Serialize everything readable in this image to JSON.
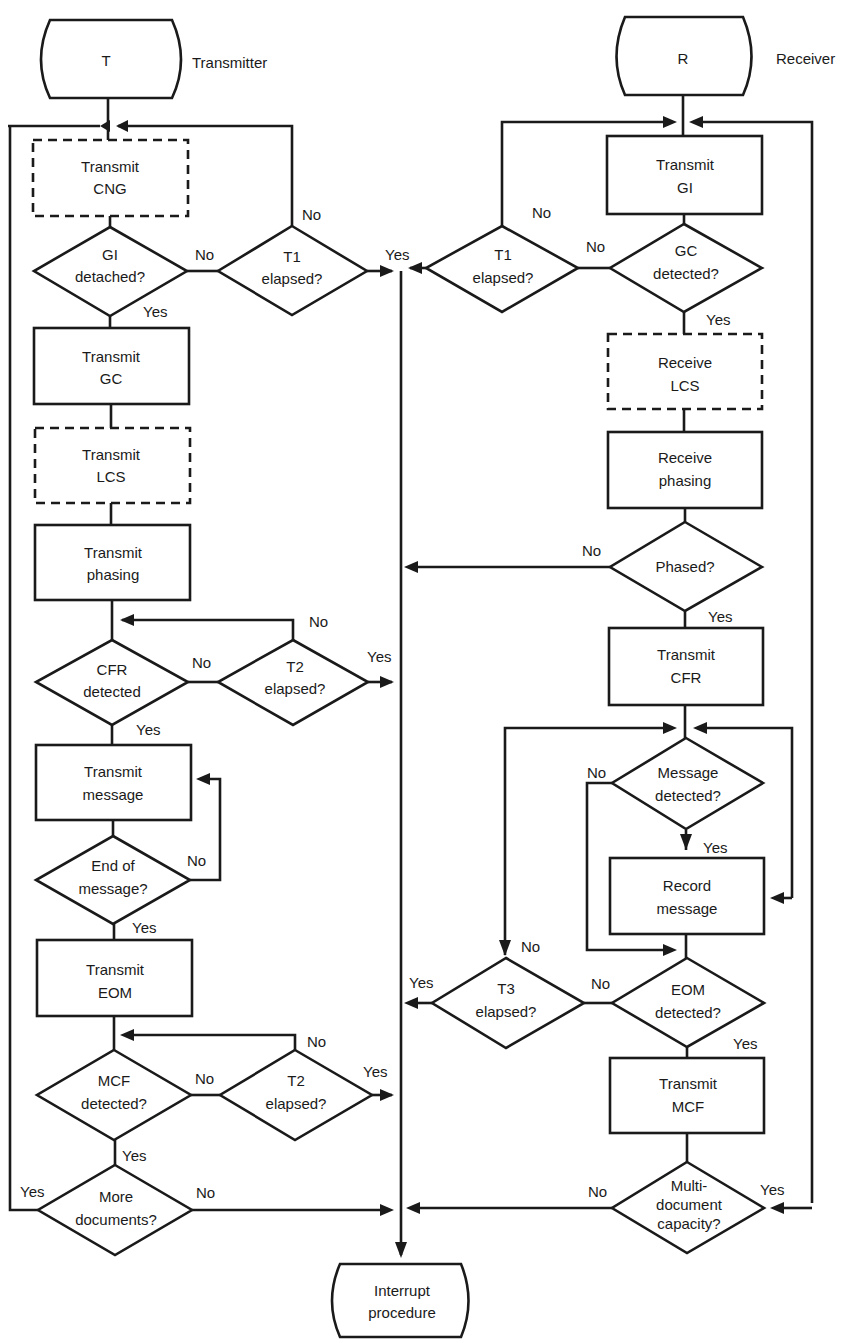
{
  "colors": {
    "stroke": "#1a1a1a",
    "background": "#ffffff"
  },
  "terminals": {
    "transmitter": {
      "symbol": "T",
      "caption": "Transmitter"
    },
    "receiver": {
      "symbol": "R",
      "caption": "Receiver"
    },
    "interrupt": {
      "line1": "Interrupt",
      "line2": "procedure"
    }
  },
  "transmitter": {
    "transmit_cng": {
      "line1": "Transmit",
      "line2": "CNG",
      "style": "dashed"
    },
    "gi_detached": {
      "line1": "GI",
      "line2": "detached?"
    },
    "t1_elapsed": {
      "line1": "T1",
      "line2": "elapsed?"
    },
    "transmit_gc": {
      "line1": "Transmit",
      "line2": "GC"
    },
    "transmit_lcs": {
      "line1": "Transmit",
      "line2": "LCS",
      "style": "dashed"
    },
    "transmit_phasing": {
      "line1": "Transmit",
      "line2": "phasing"
    },
    "cfr_detected": {
      "line1": "CFR",
      "line2": "detected"
    },
    "t2_elapsed_a": {
      "line1": "T2",
      "line2": "elapsed?"
    },
    "transmit_message": {
      "line1": "Transmit",
      "line2": "message"
    },
    "end_of_message": {
      "line1": "End of",
      "line2": "message?"
    },
    "transmit_eom": {
      "line1": "Transmit",
      "line2": "EOM"
    },
    "mcf_detected": {
      "line1": "MCF",
      "line2": "detected?"
    },
    "t2_elapsed_b": {
      "line1": "T2",
      "line2": "elapsed?"
    },
    "more_documents": {
      "line1": "More",
      "line2": "documents?"
    }
  },
  "receiver": {
    "transmit_gi": {
      "line1": "Transmit",
      "line2": "GI"
    },
    "t1_elapsed": {
      "line1": "T1",
      "line2": "elapsed?"
    },
    "gc_detected": {
      "line1": "GC",
      "line2": "detected?"
    },
    "receive_lcs": {
      "line1": "Receive",
      "line2": "LCS",
      "style": "dashed"
    },
    "receive_phasing": {
      "line1": "Receive",
      "line2": "phasing"
    },
    "phased": {
      "line1": "Phased?"
    },
    "transmit_cfr": {
      "line1": "Transmit",
      "line2": "CFR"
    },
    "message_detected": {
      "line1": "Message",
      "line2": "detected?"
    },
    "record_message": {
      "line1": "Record",
      "line2": "message"
    },
    "t3_elapsed": {
      "line1": "T3",
      "line2": "elapsed?"
    },
    "eom_detected": {
      "line1": "EOM",
      "line2": "detected?"
    },
    "transmit_mcf": {
      "line1": "Transmit",
      "line2": "MCF"
    },
    "multi_document": {
      "line1": "Multi-",
      "line2": "document",
      "line3": "capacity?"
    }
  },
  "labels": {
    "yes": "Yes",
    "no": "No"
  }
}
